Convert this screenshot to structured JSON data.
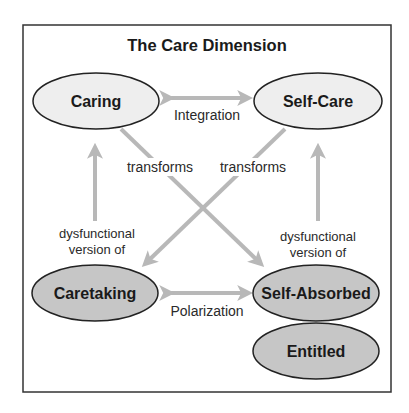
{
  "title": "The Care Dimension",
  "colors": {
    "healthy_fill": "#eeeeee",
    "dysfunctional_fill": "#c6c6c6",
    "arrow": "#b8b8b8",
    "stroke": "#222222"
  },
  "nodes": {
    "caring": "Caring",
    "self_care": "Self-Care",
    "caretaking": "Caretaking",
    "self_absorbed": "Self-Absorbed",
    "entitled": "Entitled"
  },
  "edges": {
    "integration": "Integration",
    "polarization": "Polarization",
    "transforms_left": "transforms",
    "transforms_right": "transforms",
    "dysfunctional_left_line1": "dysfunctional",
    "dysfunctional_left_line2": "version of",
    "dysfunctional_right_line1": "dysfunctional",
    "dysfunctional_right_line2": "version of"
  }
}
